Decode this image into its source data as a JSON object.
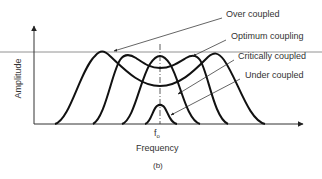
{
  "figure": {
    "caption": "(b)",
    "x_axis_label": "Frequency",
    "y_axis_label": "Amplitude",
    "center_marker": {
      "symbol": "f",
      "subscript": "o"
    }
  },
  "curves": [
    {
      "name": "Over coupled",
      "label": "Over coupled"
    },
    {
      "name": "Optimum coupling",
      "label": "Optimum coupling"
    },
    {
      "name": "Critically coupled",
      "label": "Critically coupled"
    },
    {
      "name": "Under coupled",
      "label": "Under coupled"
    }
  ],
  "colors": {
    "curve": "#111111",
    "axis": "#333333",
    "reference_line": "#777777",
    "text": "#333333"
  }
}
